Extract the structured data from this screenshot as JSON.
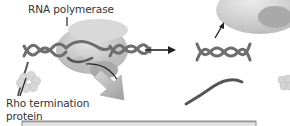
{
  "diagram": {
    "labels": {
      "rna_polymerase": "RNA polymerase",
      "rho_line1": "Rho termination",
      "rho_line2": "protein"
    },
    "colors": {
      "dna": "#6e6e6e",
      "polymerase_body": "#c9c9c9",
      "polymerase_inner": "#a8a8a8",
      "rna": "#555555",
      "rho": "#d6d6d6",
      "arrow": "#222222",
      "big_arrow": "#b5b5b5",
      "bottom_bar": "#d0d0d0"
    },
    "stages": [
      {
        "name": "elongation-with-rho",
        "elements": [
          "dna-helix",
          "rna-polymerase",
          "rna-transcript",
          "rho-protein"
        ]
      },
      {
        "name": "termination",
        "elements": [
          "released-polymerase",
          "dna-helix",
          "released-rna",
          "rho-protein"
        ]
      }
    ]
  }
}
